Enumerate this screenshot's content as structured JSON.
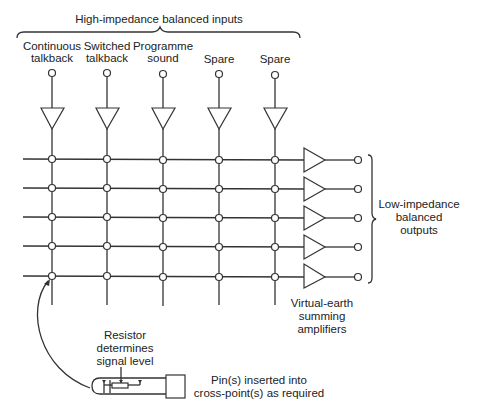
{
  "title": "High-impedance balanced inputs",
  "inputs": [
    {
      "line1": "Continuous",
      "line2": "talkback"
    },
    {
      "line1": "Switched",
      "line2": "talkback"
    },
    {
      "line1": "Programme",
      "line2": "sound"
    },
    {
      "line1": "",
      "line2": "Spare"
    },
    {
      "line1": "",
      "line2": "Spare"
    }
  ],
  "outputs_label": {
    "line1": "Low-impedance",
    "line2": "balanced",
    "line3": "outputs"
  },
  "amplifiers_label": {
    "line1": "Virtual-earth",
    "line2": "summing",
    "line3": "amplifiers"
  },
  "resistor_label": {
    "line1": "Resistor",
    "line2": "determines",
    "line3": "signal level"
  },
  "pin_label": {
    "line1": "Pin(s) inserted into",
    "line2": "cross-point(s) as required"
  },
  "matrix": {
    "columns": 5,
    "rows": 5
  }
}
